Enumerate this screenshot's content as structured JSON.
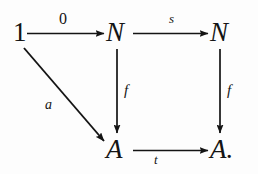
{
  "figure": {
    "kind": "commutative-diagram",
    "background_color": "#fdfdfd",
    "ink_color": "#141414"
  },
  "nodes": [
    {
      "id": "one",
      "label": "1",
      "style": "upright",
      "x": 19,
      "y": 32
    },
    {
      "id": "n-top-left",
      "label": "N",
      "style": "italic",
      "x": 118,
      "y": 32
    },
    {
      "id": "n-top-right",
      "label": "N",
      "style": "italic",
      "x": 222,
      "y": 32
    },
    {
      "id": "a-bottom-left",
      "label": "A",
      "style": "italic",
      "x": 118,
      "y": 149
    },
    {
      "id": "a-bottom-right",
      "label": "A.",
      "style": "italic",
      "x": 222,
      "y": 149
    }
  ],
  "arrows": [
    {
      "id": "zero-arrow",
      "label": "0",
      "label_style": "upright",
      "from": "one",
      "to": "n-top-left",
      "direction": "right",
      "x1": 27,
      "y1": 33,
      "x2": 104,
      "y2": 33
    },
    {
      "id": "successor-arrow",
      "label": "s",
      "label_style": "italic",
      "from": "n-top-left",
      "to": "n-top-right",
      "direction": "right",
      "x1": 133,
      "y1": 33,
      "x2": 208,
      "y2": 33
    },
    {
      "id": "f-left-arrow",
      "label": "f",
      "label_style": "italic",
      "from": "n-top-left",
      "to": "a-bottom-left",
      "direction": "down",
      "x1": 117,
      "y1": 48,
      "x2": 117,
      "y2": 134
    },
    {
      "id": "f-right-arrow",
      "label": "f",
      "label_style": "italic",
      "from": "n-top-right",
      "to": "a-bottom-right",
      "direction": "down",
      "x1": 220,
      "y1": 48,
      "x2": 220,
      "y2": 134
    },
    {
      "id": "t-arrow",
      "label": "t",
      "label_style": "italic",
      "from": "a-bottom-left",
      "to": "a-bottom-right",
      "direction": "right",
      "x1": 133,
      "y1": 150,
      "x2": 208,
      "y2": 150
    },
    {
      "id": "a-diagonal-arrow",
      "label": "a",
      "label_style": "italic",
      "from": "one",
      "to": "a-bottom-left",
      "direction": "diagonal-down-right",
      "x1": 24,
      "y1": 48,
      "x2": 104,
      "y2": 141
    }
  ],
  "labels": {
    "zero": "0",
    "successor": "s",
    "f_left": "f",
    "f_right": "f",
    "t": "t",
    "a": "a"
  },
  "node_labels": {
    "one": "1",
    "n_top_left": "N",
    "n_top_right": "N",
    "a_bottom_left": "A",
    "a_bottom_right": "A."
  }
}
